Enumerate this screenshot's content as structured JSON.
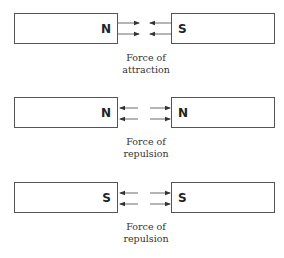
{
  "diagram": {
    "colors": {
      "line": "#555555",
      "text": "#222222",
      "caption": "#333333"
    },
    "rows": [
      {
        "left_pole": "N",
        "right_pole": "S",
        "caption_line1": "Force of",
        "caption_line2": "attraction",
        "arrow_direction": "inward"
      },
      {
        "left_pole": "N",
        "right_pole": "N",
        "caption_line1": "Force of",
        "caption_line2": "repulsion",
        "arrow_direction": "outward"
      },
      {
        "left_pole": "S",
        "right_pole": "S",
        "caption_line1": "Force of",
        "caption_line2": "repulsion",
        "arrow_direction": "outward"
      }
    ]
  }
}
